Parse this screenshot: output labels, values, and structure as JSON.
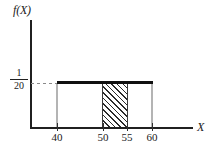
{
  "figure": {
    "y_axis_label": "f(X)",
    "x_axis_label": "X",
    "density_label": {
      "numerator": "1",
      "denominator": "20"
    }
  },
  "ticks": [
    {
      "value": 40,
      "label": "40",
      "px": 57
    },
    {
      "value": 50,
      "label": "50",
      "px": 103
    },
    {
      "value": 55,
      "label": "55",
      "px": 127
    },
    {
      "value": 60,
      "label": "60",
      "px": 152
    }
  ],
  "chart_data": {
    "type": "line",
    "title": "",
    "xlabel": "X",
    "ylabel": "f(X)",
    "xlim": [
      30,
      72
    ],
    "ylim": [
      0,
      0.075
    ],
    "grid": false,
    "legend": null,
    "xticks": [
      40,
      50,
      55,
      60
    ],
    "xticklabels": [
      "40",
      "50",
      "55",
      "60"
    ],
    "yticks": [
      0.05
    ],
    "yticklabels": [
      "1/20"
    ],
    "series": [
      {
        "name": "Uniform density f(X)",
        "x": [
          40,
          60
        ],
        "values": [
          0.05,
          0.05
        ],
        "style": "thick-solid"
      }
    ],
    "shaded_region": {
      "name": "P(50 < X < 55)",
      "x_start": 50,
      "x_end": 55,
      "y_top": 0.05,
      "y_bottom": 0,
      "fill": "diagonal-hatch",
      "area": 0.25
    },
    "annotations": [
      {
        "text": "1/20",
        "type": "y-axis-value",
        "value": 0.05
      },
      {
        "text": "f(X)",
        "type": "axis-label",
        "axis": "y"
      },
      {
        "text": "X",
        "type": "axis-label",
        "axis": "x"
      }
    ],
    "colors": {
      "axis": "#202020",
      "density_line": "#101010",
      "hatch": "#2b2b2b",
      "guide": "#b4b4b4",
      "background": "#ffffff"
    }
  }
}
